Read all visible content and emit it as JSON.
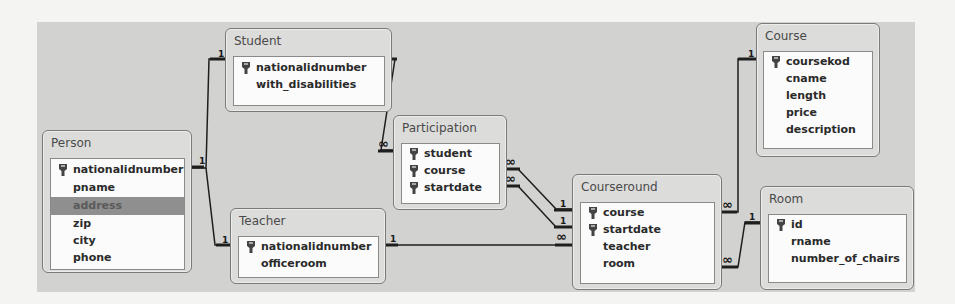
{
  "diagram": {
    "tables": {
      "person": {
        "name": "Person",
        "fields": [
          {
            "name": "nationalidnumber",
            "pk": true
          },
          {
            "name": "pname",
            "pk": false
          },
          {
            "name": "address",
            "pk": false,
            "selected": true
          },
          {
            "name": "zip",
            "pk": false
          },
          {
            "name": "city",
            "pk": false
          },
          {
            "name": "phone",
            "pk": false
          }
        ]
      },
      "student": {
        "name": "Student",
        "fields": [
          {
            "name": "nationalidnumber",
            "pk": true
          },
          {
            "name": "with_disabilities",
            "pk": false
          }
        ]
      },
      "teacher": {
        "name": "Teacher",
        "fields": [
          {
            "name": "nationalidnumber",
            "pk": true
          },
          {
            "name": "officeroom",
            "pk": false
          }
        ]
      },
      "participation": {
        "name": "Participation",
        "fields": [
          {
            "name": "student",
            "pk": true
          },
          {
            "name": "course",
            "pk": true
          },
          {
            "name": "startdate",
            "pk": true
          }
        ]
      },
      "courseround": {
        "name": "Courseround",
        "fields": [
          {
            "name": "course",
            "pk": true
          },
          {
            "name": "startdate",
            "pk": true
          },
          {
            "name": "teacher",
            "pk": false
          },
          {
            "name": "room",
            "pk": false
          }
        ]
      },
      "course": {
        "name": "Course",
        "fields": [
          {
            "name": "coursekod",
            "pk": true
          },
          {
            "name": "cname",
            "pk": false
          },
          {
            "name": "length",
            "pk": false
          },
          {
            "name": "price",
            "pk": false
          },
          {
            "name": "description",
            "pk": false
          }
        ]
      },
      "room": {
        "name": "Room",
        "fields": [
          {
            "name": "id",
            "pk": true
          },
          {
            "name": "rname",
            "pk": false
          },
          {
            "name": "number_of_chairs",
            "pk": false
          }
        ]
      }
    },
    "relationships": [
      {
        "from": "Person.nationalidnumber",
        "to": "Student.nationalidnumber",
        "from_card": "1",
        "to_card": "1"
      },
      {
        "from": "Person.nationalidnumber",
        "to": "Teacher.nationalidnumber",
        "from_card": "1",
        "to_card": "1"
      },
      {
        "from": "Student.nationalidnumber",
        "to": "Participation.student",
        "from_card": "1",
        "to_card": "∞"
      },
      {
        "from": "Courseround.course",
        "to": "Participation.course",
        "from_card": "1",
        "to_card": "∞"
      },
      {
        "from": "Courseround.startdate",
        "to": "Participation.startdate",
        "from_card": "1",
        "to_card": "∞"
      },
      {
        "from": "Teacher.nationalidnumber",
        "to": "Courseround.teacher",
        "from_card": "1",
        "to_card": "∞"
      },
      {
        "from": "Course.coursekod",
        "to": "Courseround.course",
        "from_card": "1",
        "to_card": "∞"
      },
      {
        "from": "Room.id",
        "to": "Courseround.room",
        "from_card": "1",
        "to_card": "∞"
      }
    ],
    "cardinality": {
      "one": "1",
      "many": "∞"
    }
  }
}
